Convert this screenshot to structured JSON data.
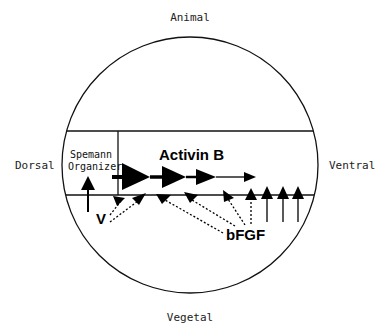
{
  "diagram": {
    "labels": {
      "top": "Animal",
      "bottom": "Vegetal",
      "left": "Dorsal",
      "right": "Ventral"
    },
    "organizer": {
      "line1": "Spemann",
      "line2": "Organizer"
    },
    "signals": {
      "activin": "Activin B",
      "fgf": "bFGF",
      "v": "V"
    },
    "colors": {
      "stroke": "#111111",
      "background": "#ffffff",
      "label": "#222222"
    }
  }
}
